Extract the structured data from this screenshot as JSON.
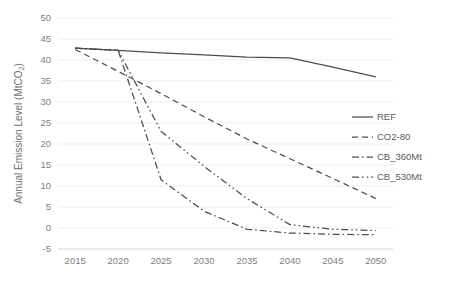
{
  "chart_data": {
    "type": "line",
    "title": "",
    "xlabel": "",
    "ylabel": "Annual Emission Level (MtCO2)",
    "ylabel_main": "Annual Emission Level (MtCO",
    "ylabel_sub": "2",
    "ylabel_tail": ")",
    "x": [
      2015,
      2020,
      2025,
      2030,
      2035,
      2040,
      2045,
      2050
    ],
    "xlim": [
      2013,
      2052
    ],
    "ylim": [
      -5,
      50
    ],
    "yticks": [
      50,
      45,
      40,
      35,
      30,
      25,
      20,
      15,
      10,
      5,
      0,
      -5
    ],
    "xticks": [
      2015,
      2020,
      2025,
      2030,
      2035,
      2040,
      2045,
      2050
    ],
    "grid": true,
    "legend_position": "right",
    "series": [
      {
        "name": "REF",
        "style": "solid",
        "color": "#4d4d4d",
        "x": [
          2015,
          2020,
          2025,
          2030,
          2035,
          2040,
          2045,
          2050
        ],
        "values": [
          42.8,
          42.3,
          41.7,
          41.2,
          40.7,
          40.5,
          38.3,
          36.0
        ]
      },
      {
        "name": "CO2-80",
        "style": "dashed",
        "color": "#4d4d4d",
        "x": [
          2015,
          2020,
          2025,
          2030,
          2035,
          2040,
          2045,
          2050
        ],
        "values": [
          42.5,
          37.3,
          32.0,
          26.5,
          21.2,
          16.5,
          11.8,
          7.0
        ]
      },
      {
        "name": "CB_360Mt",
        "style": "dashdot",
        "color": "#4d4d4d",
        "x": [
          2015,
          2020,
          2025,
          2030,
          2035,
          2040,
          2045,
          2050
        ],
        "values": [
          42.8,
          42.3,
          11.5,
          4.0,
          -0.3,
          -1.2,
          -1.5,
          -1.6
        ]
      },
      {
        "name": "CB_530Mt",
        "style": "dashdotdot",
        "color": "#4d4d4d",
        "x": [
          2015,
          2020,
          2025,
          2030,
          2035,
          2040,
          2045,
          2050
        ],
        "values": [
          42.8,
          42.3,
          23.0,
          14.7,
          7.0,
          0.8,
          -0.3,
          -0.6
        ]
      }
    ],
    "legend": [
      {
        "label": "REF",
        "style": "solid"
      },
      {
        "label": "CO2-80",
        "style": "dashed"
      },
      {
        "label": "CB_360Mt",
        "style": "dashdot"
      },
      {
        "label": "CB_530Mt",
        "style": "dashdotdot"
      }
    ]
  }
}
